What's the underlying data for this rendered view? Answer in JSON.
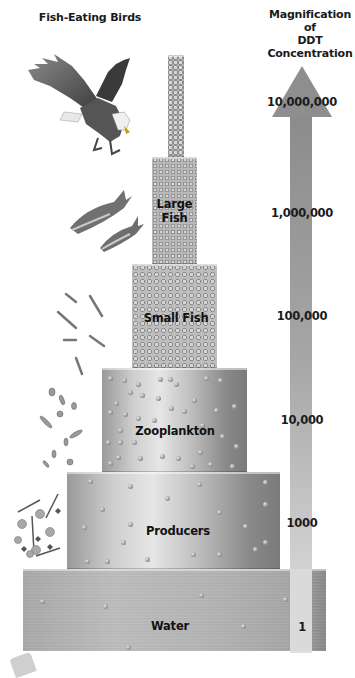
{
  "diagram": {
    "left_title": "Fish-Eating Birds",
    "right_title_line1": "Magnification of",
    "right_title_line2": "DDT Concentration",
    "levels": [
      {
        "name": "Fish-Eating Birds",
        "label": "",
        "magnification": "10,000,000"
      },
      {
        "name": "Large Fish",
        "label_line1": "Large",
        "label_line2": "Fish",
        "magnification": "1,000,000"
      },
      {
        "name": "Small Fish",
        "label": "Small Fish",
        "magnification": "100,000"
      },
      {
        "name": "Zooplankton",
        "label": "Zooplankton",
        "magnification": "10,000"
      },
      {
        "name": "Producers",
        "label": "Producers",
        "magnification": "1000"
      },
      {
        "name": "Water",
        "label": "Water",
        "magnification": "1"
      }
    ],
    "icons": {
      "birds": "eagle-illustration",
      "large_fish": "fish-illustration",
      "small_fish": "small-fish-illustration",
      "zooplankton": "zooplankton-illustration",
      "producers": "phytoplankton-illustration"
    },
    "colors": {
      "block_dark": "#7a7a7a",
      "block_light": "#e6e6e6",
      "arrow": "#8f8f8f",
      "arrow_fade": "#dcdcdc",
      "text": "#111111"
    }
  }
}
